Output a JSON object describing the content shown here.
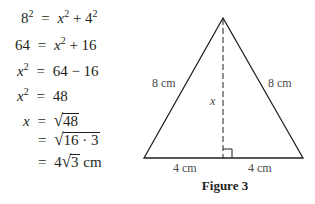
{
  "derivation": {
    "steps": [
      {
        "lhs_base": "8",
        "lhs_exp": "2",
        "eq": "=",
        "rhs": [
          {
            "t": "x",
            "italic": true
          },
          {
            "t": "2",
            "sup": true
          },
          {
            "t": " + 4"
          },
          {
            "t": "2",
            "sup": true
          }
        ]
      },
      {
        "lhs": "64",
        "eq": "=",
        "rhs_text": "x² + 16"
      },
      {
        "lhs": "x²",
        "eq": "=",
        "rhs_text": "64 − 16"
      },
      {
        "lhs": "x²",
        "eq": "=",
        "rhs_text": "48"
      },
      {
        "lhs": "x",
        "eq": "=",
        "rhs_text": "√48"
      },
      {
        "lhs": "",
        "eq": "=",
        "rhs_text": "√(16 · 3)"
      },
      {
        "lhs": "",
        "eq": "=",
        "rhs_text": "4√3 cm"
      }
    ],
    "labels": {
      "s1_lhs": "8",
      "s1_lhs_exp": "2",
      "s1_rhs_x": "x",
      "s1_rhs_exp": "2",
      "s1_rhs_plus": " + 4",
      "s1_rhs_exp2": "2",
      "s2_lhs": "64",
      "s2_rhs_x": "x",
      "s2_rhs_exp": "2",
      "s2_rhs_rest": " + 16",
      "s3_lhs_x": "x",
      "s3_lhs_exp": "2",
      "s3_rhs": "64 − 16",
      "s4_lhs_x": "x",
      "s4_lhs_exp": "2",
      "s4_rhs": "48",
      "s5_lhs_x": "x",
      "s5_rad": "48",
      "s6_rad": "16 · 3",
      "s7_coef": "4",
      "s7_rad": "3",
      "s7_unit": " cm",
      "eq": "=",
      "radical": "√"
    }
  },
  "figure": {
    "caption": "Figure 3",
    "shape": "isosceles-triangle",
    "vertices": {
      "apex": [
        223,
        18
      ],
      "left": [
        144,
        158
      ],
      "right": [
        303,
        158
      ]
    },
    "altitude": {
      "label": "x",
      "style": "dashed",
      "right_angle_marker": true
    },
    "side_labels": {
      "left_side": "8 cm",
      "right_side": "8 cm",
      "base_left": "4 cm",
      "base_right": "4 cm",
      "altitude": "x"
    },
    "colors": {
      "stroke": "#231f20",
      "label": "#4a4a4a"
    }
  }
}
